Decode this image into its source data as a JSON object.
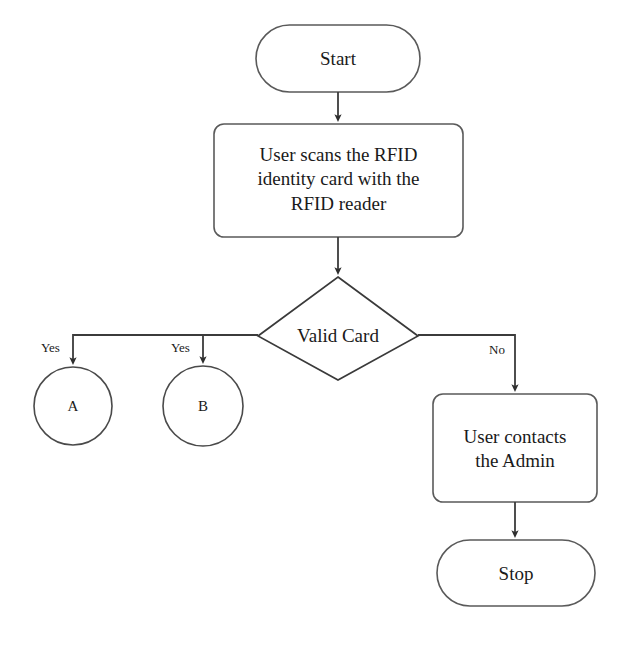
{
  "diagram": {
    "stroke_color": "#3b3b3b",
    "node_stroke_color": "#5a5a5a",
    "background_color": "#ffffff",
    "text_color": "#1a1a1a"
  },
  "nodes": {
    "start": {
      "label": "Start",
      "shape": "terminator"
    },
    "scan": {
      "label": "User scans the RFID\nidentity card with the\nRFID reader",
      "shape": "process"
    },
    "decision": {
      "label": "Valid Card",
      "shape": "decision"
    },
    "connector_a": {
      "label": "A",
      "shape": "circle"
    },
    "connector_b": {
      "label": "B",
      "shape": "circle"
    },
    "admin": {
      "label": "User contacts\nthe Admin",
      "shape": "process"
    },
    "stop": {
      "label": "Stop",
      "shape": "terminator"
    }
  },
  "edges": {
    "start_to_scan": {
      "label": ""
    },
    "scan_to_decision": {
      "label": ""
    },
    "decision_to_a": {
      "label": "Yes"
    },
    "decision_to_b": {
      "label": "Yes"
    },
    "decision_to_admin": {
      "label": "No"
    },
    "admin_to_stop": {
      "label": ""
    }
  }
}
